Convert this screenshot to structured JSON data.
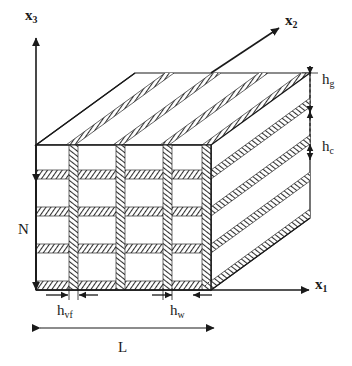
{
  "figure": {
    "type": "3d-isometric-technical-diagram",
    "stroke_color": "#1a1a1a",
    "hatch_color": "#3a3a3a",
    "face_color": "#ffffff"
  },
  "axes": [
    {
      "id": "x3",
      "label": "x",
      "subscript": "3",
      "direction": "up",
      "tail": [
        36,
        290
      ],
      "head": [
        36,
        36
      ]
    },
    {
      "id": "x2",
      "label": "x",
      "subscript": "2",
      "direction": "up-right-depth",
      "tail": [
        211,
        73
      ],
      "head": [
        280,
        27
      ]
    },
    {
      "id": "x1",
      "label": "x",
      "subscript": "1",
      "direction": "right",
      "tail": [
        36,
        290
      ],
      "head": [
        311,
        290
      ]
    }
  ],
  "dimensions": [
    {
      "id": "hg",
      "label": "h",
      "subscript": "g",
      "orientation": "vertical",
      "from": [
        310,
        73
      ],
      "to": [
        310,
        112
      ],
      "arrows": "outward",
      "side": "right"
    },
    {
      "id": "hc",
      "label": "h",
      "subscript": "c",
      "orientation": "vertical",
      "from": [
        310,
        112
      ],
      "to": [
        310,
        152
      ],
      "arrows": "outward",
      "side": "right"
    },
    {
      "id": "N",
      "label": "N",
      "subscript": "",
      "orientation": "vertical",
      "from": [
        36,
        182
      ],
      "to": [
        36,
        290
      ],
      "arrows": "double",
      "side": "left"
    },
    {
      "id": "hvf",
      "label": "h",
      "subscript": "vf",
      "orientation": "horizontal",
      "from": [
        50,
        295
      ],
      "to": [
        88,
        295
      ],
      "arrows": "inward",
      "side": "bottom"
    },
    {
      "id": "hw",
      "label": "h",
      "subscript": "w",
      "orientation": "horizontal",
      "from": [
        155,
        295
      ],
      "to": [
        198,
        295
      ],
      "arrows": "inward",
      "side": "bottom"
    },
    {
      "id": "L",
      "label": "L",
      "subscript": "",
      "orientation": "horizontal",
      "from": [
        40,
        328
      ],
      "to": [
        214,
        328
      ],
      "arrows": "double",
      "side": "bottom"
    }
  ],
  "geometry": {
    "front_face": {
      "left": 36,
      "right": 211,
      "top": 73,
      "bottom": 290,
      "note": "front face offset up by depth at top"
    },
    "front_rect": {
      "x": 36,
      "y": 145,
      "w": 175,
      "h": 145
    },
    "depth_vector": {
      "dx": 99,
      "dy": -72
    },
    "front_grid": {
      "horizontal_bands_y": [
        170,
        207,
        244,
        281
      ],
      "vertical_bands_x": [
        69,
        116,
        163,
        205
      ],
      "band_thickness": 9
    },
    "top_face_stripes": 4,
    "side_face_stripes": 4
  }
}
